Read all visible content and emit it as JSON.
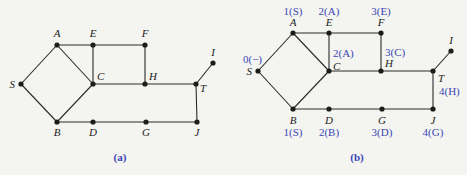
{
  "diagrams": [
    {
      "id": "a",
      "caption": "(a)",
      "nodes": [
        {
          "name": "A",
          "x": 57,
          "y": 45,
          "lx": 57,
          "ly": 37,
          "anchor": "middle"
        },
        {
          "name": "E",
          "x": 93,
          "y": 45,
          "lx": 93,
          "ly": 37,
          "anchor": "middle"
        },
        {
          "name": "F",
          "x": 145,
          "y": 45,
          "lx": 145,
          "ly": 37,
          "anchor": "middle"
        },
        {
          "name": "S",
          "x": 21,
          "y": 84,
          "lx": 15,
          "ly": 88,
          "anchor": "end"
        },
        {
          "name": "C",
          "x": 93,
          "y": 84,
          "lx": 97,
          "ly": 80,
          "anchor": "start"
        },
        {
          "name": "H",
          "x": 145,
          "y": 84,
          "lx": 149,
          "ly": 80,
          "anchor": "start"
        },
        {
          "name": "T",
          "x": 196,
          "y": 84,
          "lx": 200,
          "ly": 92,
          "anchor": "start"
        },
        {
          "name": "I",
          "x": 213,
          "y": 63,
          "lx": 213,
          "ly": 56,
          "anchor": "middle"
        },
        {
          "name": "B",
          "x": 57,
          "y": 122,
          "lx": 57,
          "ly": 136,
          "anchor": "middle"
        },
        {
          "name": "D",
          "x": 93,
          "y": 122,
          "lx": 93,
          "ly": 136,
          "anchor": "middle"
        },
        {
          "name": "G",
          "x": 146,
          "y": 122,
          "lx": 146,
          "ly": 136,
          "anchor": "middle"
        },
        {
          "name": "J",
          "x": 197,
          "y": 122,
          "lx": 197,
          "ly": 136,
          "anchor": "middle"
        }
      ],
      "caption_pos": {
        "x": 120,
        "y": 161
      }
    },
    {
      "id": "b",
      "caption": "(b)",
      "nodes": [
        {
          "name": "A",
          "x": 293,
          "y": 33,
          "lx": 293,
          "ly": 26,
          "anchor": "middle",
          "bfs": "1(S)",
          "bx": 293,
          "by": 15,
          "banchor": "middle"
        },
        {
          "name": "E",
          "x": 329,
          "y": 33,
          "lx": 329,
          "ly": 26,
          "anchor": "middle",
          "bfs": "2(A)",
          "bx": 329,
          "by": 15,
          "banchor": "middle"
        },
        {
          "name": "F",
          "x": 381,
          "y": 33,
          "lx": 381,
          "ly": 26,
          "anchor": "middle",
          "bfs": "3(E)",
          "bx": 381,
          "by": 15,
          "banchor": "middle"
        },
        {
          "name": "S",
          "x": 258,
          "y": 71,
          "lx": 252,
          "ly": 75,
          "anchor": "end",
          "bfs": "0(−)",
          "bx": 262,
          "by": 63,
          "banchor": "end"
        },
        {
          "name": "C",
          "x": 329,
          "y": 71,
          "lx": 333,
          "ly": 70,
          "anchor": "start",
          "bfs": "2(A)",
          "bx": 333,
          "by": 57,
          "banchor": "start"
        },
        {
          "name": "H",
          "x": 381,
          "y": 71,
          "lx": 385,
          "ly": 67,
          "anchor": "start",
          "bfs": "3(C)",
          "bx": 385,
          "by": 56,
          "banchor": "start"
        },
        {
          "name": "T",
          "x": 433,
          "y": 71,
          "lx": 438,
          "ly": 82,
          "anchor": "start",
          "bfs": "4(H)",
          "bx": 439,
          "by": 95,
          "banchor": "start"
        },
        {
          "name": "I",
          "x": 451,
          "y": 51,
          "lx": 451,
          "ly": 44,
          "anchor": "middle"
        },
        {
          "name": "B",
          "x": 293,
          "y": 109,
          "lx": 293,
          "ly": 124,
          "anchor": "middle",
          "bfs": "1(S)",
          "bx": 293,
          "by": 136,
          "banchor": "middle"
        },
        {
          "name": "D",
          "x": 329,
          "y": 109,
          "lx": 329,
          "ly": 124,
          "anchor": "middle",
          "bfs": "2(B)",
          "bx": 329,
          "by": 136,
          "banchor": "middle"
        },
        {
          "name": "G",
          "x": 382,
          "y": 109,
          "lx": 382,
          "ly": 124,
          "anchor": "middle",
          "bfs": "3(D)",
          "bx": 382,
          "by": 136,
          "banchor": "middle"
        },
        {
          "name": "J",
          "x": 433,
          "y": 109,
          "lx": 433,
          "ly": 124,
          "anchor": "middle",
          "bfs": "4(G)",
          "bx": 433,
          "by": 136,
          "banchor": "middle"
        }
      ],
      "caption_pos": {
        "x": 357,
        "y": 161
      }
    }
  ],
  "edges": [
    [
      "S",
      "A"
    ],
    [
      "S",
      "B"
    ],
    [
      "A",
      "C"
    ],
    [
      "B",
      "C"
    ],
    [
      "A",
      "E"
    ],
    [
      "E",
      "F"
    ],
    [
      "E",
      "C"
    ],
    [
      "F",
      "H"
    ],
    [
      "C",
      "H"
    ],
    [
      "H",
      "T"
    ],
    [
      "T",
      "I"
    ],
    [
      "T",
      "J"
    ],
    [
      "B",
      "D"
    ],
    [
      "D",
      "G"
    ],
    [
      "G",
      "J"
    ]
  ],
  "colors": {
    "edge": "#2a2a2a",
    "node": "#1c1c1c",
    "annotation": "#3a46b4",
    "background": "#f4f4f0"
  }
}
